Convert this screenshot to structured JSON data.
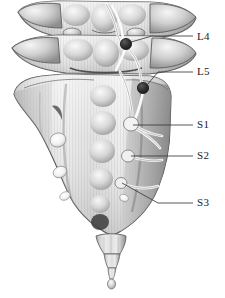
{
  "figure": {
    "background_color": "#ffffff",
    "width": 225,
    "height": 298
  },
  "palette": {
    "bone_light": "#e8e8e8",
    "bone_mid": "#c9c9c9",
    "bone_shadow": "#9a9a9a",
    "bone_dark": "#7d7d7d",
    "outline": "#4a4a4a",
    "ganglion": "#2b2b2b",
    "nerve": "#fdfdfd",
    "nerve_outline": "#6e6e6e",
    "leader_line": "#3a3a3a",
    "text": "#1a1a1a"
  },
  "labels": [
    {
      "id": "L4",
      "text": "L4",
      "x": 200,
      "y": 38,
      "leader": {
        "from_x": 126,
        "from_y": 44,
        "bend_x": 152,
        "bend_y": 36,
        "to_x": 193,
        "to_y": 36
      },
      "marker": "ganglion"
    },
    {
      "id": "L5",
      "text": "L5",
      "x": 200,
      "y": 70,
      "leader": {
        "from_x": 143,
        "from_y": 88,
        "bend_x": 158,
        "bend_y": 72,
        "to_x": 193,
        "to_y": 72
      },
      "marker": "ganglion"
    },
    {
      "id": "S1",
      "text": "S1",
      "x": 200,
      "y": 120,
      "leader": {
        "from_x": 133,
        "from_y": 125,
        "bend_x": 150,
        "bend_y": 125,
        "to_x": 193,
        "to_y": 125
      },
      "marker": "nerve-root"
    },
    {
      "id": "S2",
      "text": "S2",
      "x": 200,
      "y": 151,
      "leader": {
        "from_x": 131,
        "from_y": 156,
        "bend_x": 150,
        "bend_y": 156,
        "to_x": 193,
        "to_y": 156
      },
      "marker": "nerve-root"
    },
    {
      "id": "S3",
      "text": "S3",
      "x": 200,
      "y": 198,
      "leader": {
        "from_x": 123,
        "from_y": 183,
        "bend_x": 158,
        "bend_y": 203,
        "to_x": 193,
        "to_y": 203
      },
      "marker": "nerve-root"
    }
  ],
  "anatomy": {
    "vertebrae": [
      {
        "name": "L4-vertebra",
        "level": "L4"
      },
      {
        "name": "L5-vertebra",
        "level": "L5"
      }
    ],
    "sacrum": {
      "name": "sacrum",
      "foramina_count": 4
    },
    "coccyx": {
      "name": "coccyx",
      "segments": 4
    },
    "ganglia": [
      {
        "name": "L4-dorsal-root-ganglion",
        "cx": 126,
        "cy": 44,
        "r": 5.6
      },
      {
        "name": "L5-dorsal-root-ganglion",
        "cx": 143,
        "cy": 88,
        "r": 5.6
      }
    ]
  }
}
